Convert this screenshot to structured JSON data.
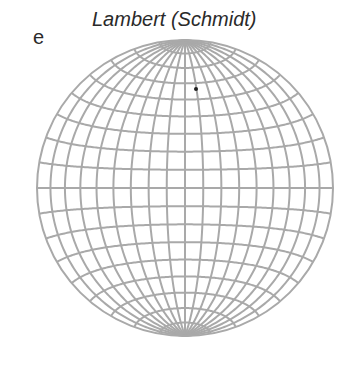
{
  "figure": {
    "panel_label": "e",
    "title": "Lambert (Schmidt)"
  },
  "net": {
    "projection": "Lambert azimuthal equal-area (Schmidt net), equatorial aspect",
    "grid_interval_deg": 10,
    "center": [
      185,
      188
    ],
    "radius_px": 148,
    "line_color": "#a9a9a9",
    "line_width": 2,
    "plotted_points": [
      {
        "x": 196,
        "y": 89,
        "color": "#222222"
      }
    ]
  }
}
